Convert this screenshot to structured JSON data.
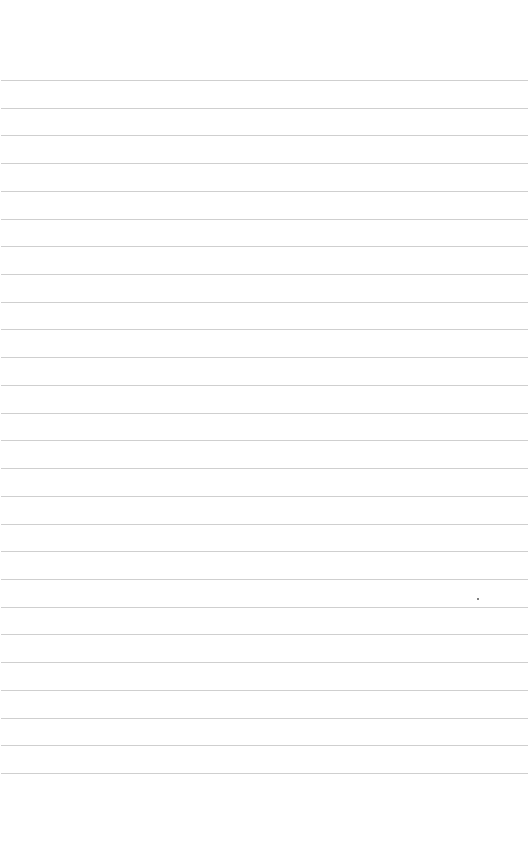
{
  "page": {
    "type": "lined-paper",
    "background_color": "#ffffff",
    "line_color": "#cfcfcf",
    "line_count": 26,
    "first_line_y": 80,
    "line_spacing": 27.72,
    "text": ""
  },
  "marks": [
    {
      "type": "speck",
      "x": 477,
      "y": 598
    }
  ]
}
